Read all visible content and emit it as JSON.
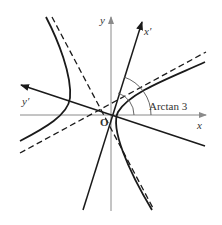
{
  "figure": {
    "type": "hyperbola with rotated axes",
    "labels": {
      "x_axis": "x",
      "y_axis": "y",
      "x_prime_axis": "x′",
      "y_prime_axis": "y′",
      "origin": "O",
      "angle": "Arctan 3"
    },
    "colors": {
      "axis": "#8a8a8a",
      "curve": "#1a1a1a",
      "rotated_axis": "#1a1a1a",
      "asymptote": "#1a1a1a",
      "text": "#333333"
    }
  }
}
